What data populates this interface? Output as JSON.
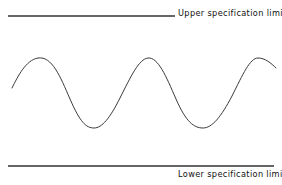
{
  "figure": {
    "type": "line-diagram",
    "background_color": "#ffffff",
    "upper_limit": {
      "label": "Upper specification limit",
      "line_color": "#666666",
      "line_width": 1.2,
      "y": 16,
      "x_start": 8,
      "x_end": 175
    },
    "lower_limit": {
      "label": "Lower specification limit",
      "line_color": "#666666",
      "line_width": 1.2,
      "y": 166,
      "x_start": 8,
      "x_end": 274
    },
    "curve": {
      "name": "process-variation-wave",
      "stroke_color": "#3a3a3a",
      "stroke_width": 1,
      "path": "M 12 88 C 18 76, 26 60, 38 58 C 52 56, 60 76, 70 99 C 80 122, 86 128, 94 128 C 102 128, 110 118, 120 98 C 131 76, 139 59, 148 58 C 158 57, 166 76, 176 99 C 186 122, 194 128, 203 128 C 212 128, 221 117, 232 96 C 243 74, 250 58, 258 58 C 265 58, 271 63, 276 68"
    }
  },
  "chart_data": {
    "type": "line",
    "title": "",
    "xlabel": "",
    "ylabel": "",
    "grid": false,
    "legend": "none",
    "annotations": [
      {
        "text": "Upper specification limit",
        "position": "top-right"
      },
      {
        "text": "Lower specification limit",
        "position": "bottom-right"
      }
    ],
    "reference_lines": [
      {
        "name": "Upper specification limit",
        "orientation": "horizontal",
        "y_pixel": 16
      },
      {
        "name": "Lower specification limit",
        "orientation": "horizontal",
        "y_pixel": 166
      }
    ],
    "series": [
      {
        "name": "process-variation-wave",
        "description": "sinusoidal process output oscillating between the two specification limits",
        "cycles": 3,
        "peak_y_pixel": 58,
        "trough_y_pixel": 128,
        "x": [
          12,
          38,
          94,
          148,
          203,
          258,
          276
        ],
        "y": [
          88,
          58,
          128,
          58,
          128,
          58,
          68
        ],
        "point_kinds": [
          "start",
          "peak",
          "trough",
          "peak",
          "trough",
          "peak",
          "end"
        ]
      }
    ]
  }
}
